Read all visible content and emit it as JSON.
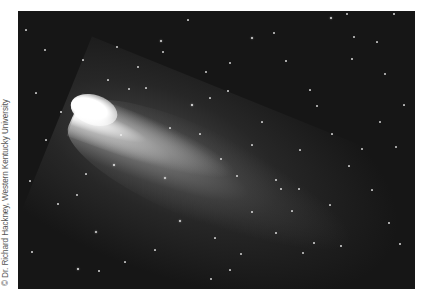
{
  "image": {
    "subject": "Comet with long bright tail against a star field",
    "credit": "© Dr. Richard Hackney, Western Kentucky University",
    "colors": {
      "sky": "#161616",
      "comet_head": "#ffffff",
      "tail": "#bdbdbd",
      "stars": "#f2f2f2",
      "page_background": "#ffffff"
    },
    "stars": [
      [
        114,
        165,
        2.2
      ],
      [
        192,
        105,
        2.4
      ],
      [
        165,
        178,
        1.8
      ],
      [
        180,
        221,
        2.0
      ],
      [
        96,
        232,
        1.8
      ],
      [
        78,
        269,
        2.2
      ],
      [
        99,
        271,
        1.6
      ],
      [
        61,
        112,
        1.6
      ],
      [
        45,
        50,
        1.4
      ],
      [
        117,
        47,
        1.4
      ],
      [
        161,
        41,
        2.0
      ],
      [
        163,
        52,
        1.4
      ],
      [
        228,
        91,
        1.6
      ],
      [
        252,
        38,
        2.0
      ],
      [
        274,
        33,
        1.4
      ],
      [
        331,
        18,
        2.0
      ],
      [
        347,
        14,
        1.4
      ],
      [
        394,
        14,
        1.6
      ],
      [
        354,
        37,
        1.4
      ],
      [
        286,
        61,
        1.6
      ],
      [
        352,
        59,
        1.6
      ],
      [
        385,
        74,
        1.4
      ],
      [
        230,
        63,
        1.4
      ],
      [
        206,
        72,
        1.4
      ],
      [
        210,
        98,
        1.2
      ],
      [
        221,
        159,
        1.4
      ],
      [
        237,
        176,
        1.4
      ],
      [
        276,
        180,
        1.6
      ],
      [
        281,
        189,
        1.6
      ],
      [
        299,
        189,
        1.6
      ],
      [
        252,
        212,
        1.6
      ],
      [
        276,
        233,
        1.6
      ],
      [
        314,
        243,
        1.6
      ],
      [
        341,
        246,
        1.6
      ],
      [
        400,
        244,
        1.6
      ],
      [
        389,
        223,
        1.6
      ],
      [
        362,
        149,
        1.4
      ],
      [
        317,
        106,
        1.4
      ],
      [
        380,
        122,
        1.4
      ],
      [
        396,
        147,
        1.4
      ],
      [
        303,
        253,
        1.4
      ],
      [
        241,
        254,
        1.4
      ],
      [
        211,
        279,
        1.4
      ],
      [
        230,
        270,
        1.2
      ],
      [
        58,
        204,
        1.6
      ],
      [
        32,
        252,
        1.6
      ],
      [
        77,
        195,
        1.4
      ],
      [
        86,
        174,
        1.2
      ],
      [
        30,
        181,
        1.2
      ],
      [
        121,
        135,
        1.4
      ],
      [
        138,
        67,
        1.4
      ],
      [
        129,
        89,
        1.4
      ],
      [
        108,
        80,
        1.2
      ],
      [
        83,
        60,
        1.2
      ],
      [
        146,
        88,
        1.2
      ],
      [
        170,
        128,
        1.2
      ],
      [
        200,
        134,
        1.2
      ],
      [
        262,
        122,
        1.2
      ],
      [
        332,
        134,
        1.2
      ],
      [
        349,
        166,
        1.2
      ],
      [
        372,
        190,
        1.2
      ],
      [
        330,
        205,
        1.2
      ],
      [
        292,
        211,
        1.2
      ],
      [
        215,
        238,
        1.2
      ],
      [
        155,
        250,
        1.2
      ],
      [
        125,
        262,
        1.2
      ],
      [
        46,
        140,
        1.2
      ],
      [
        36,
        93,
        1.2
      ],
      [
        26,
        30,
        1.2
      ],
      [
        300,
        150,
        1.2
      ],
      [
        252,
        145,
        1.2
      ],
      [
        404,
        105,
        1.2
      ],
      [
        377,
        42,
        1.2
      ],
      [
        310,
        90,
        1.2
      ],
      [
        188,
        20,
        1.2
      ]
    ]
  }
}
